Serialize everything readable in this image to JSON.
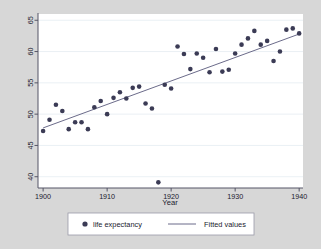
{
  "chart_data": {
    "type": "scatter",
    "title": "",
    "xlabel": "Year",
    "ylabel": "",
    "xlim": [
      1899.2,
      1940.6
    ],
    "ylim": [
      38.2,
      66.0
    ],
    "xticks": [
      1900,
      1910,
      1920,
      1930,
      1940
    ],
    "yticks": [
      40,
      45,
      50,
      55,
      60,
      65
    ],
    "grid": "horizontal",
    "legend_position": "bottom",
    "series": [
      {
        "name": "life expectancy",
        "type": "scatter",
        "marker": "circle",
        "color": "#3b3b55",
        "x": [
          1900,
          1901,
          1902,
          1903,
          1904,
          1905,
          1906,
          1907,
          1908,
          1909,
          1910,
          1911,
          1912,
          1913,
          1914,
          1915,
          1916,
          1917,
          1918,
          1919,
          1920,
          1921,
          1922,
          1923,
          1924,
          1925,
          1926,
          1927,
          1928,
          1929,
          1930,
          1931,
          1932,
          1933,
          1934,
          1935,
          1936,
          1937,
          1938,
          1939,
          1940
        ],
        "y": [
          47.3,
          49.1,
          51.5,
          50.5,
          47.6,
          48.7,
          48.7,
          47.6,
          51.1,
          52.1,
          50.0,
          52.6,
          53.5,
          52.5,
          54.2,
          54.4,
          51.7,
          50.9,
          39.1,
          54.7,
          54.1,
          60.8,
          59.6,
          57.2,
          59.7,
          59.0,
          56.7,
          60.4,
          56.8,
          57.1,
          59.7,
          61.1,
          62.1,
          63.3,
          61.1,
          61.7,
          58.5,
          60.0,
          63.5,
          63.7,
          62.9
        ]
      },
      {
        "name": "Fitted values",
        "type": "line",
        "color": "#6b6b8a",
        "x": [
          1900,
          1940
        ],
        "y": [
          47.8,
          62.8
        ]
      }
    ]
  },
  "axes": {
    "x_title": "Year",
    "x_tick_labels": [
      "1900",
      "1910",
      "1920",
      "1930",
      "1940"
    ],
    "y_tick_labels": [
      "40",
      "45",
      "50",
      "55",
      "60",
      "65"
    ]
  },
  "legend": {
    "entries": [
      {
        "label": "life expectancy",
        "glyph": "marker-dot-icon"
      },
      {
        "label": "Fitted values",
        "glyph": "line-segment-icon"
      }
    ]
  },
  "colors": {
    "figure_background": "#d7d7d7",
    "plot_background": "#ffffff",
    "marker": "#3b3b55",
    "fit_line": "#6b6b8a",
    "grid": "#e8eef3",
    "axis": "#555566",
    "text": "#1a1a2e",
    "legend_background": "#ffffff",
    "legend_border": "#9a9aa8"
  }
}
